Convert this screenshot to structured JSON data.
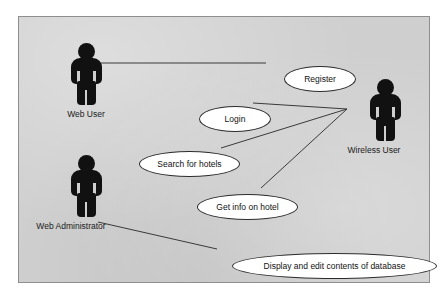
{
  "diagram": {
    "type": "uml-use-case-diagram",
    "panel": {
      "background_color": "#cfcfcf",
      "border_color": "#8e8e8e"
    },
    "scan_artifact_text": "",
    "actors": [
      {
        "id": "web-user",
        "label": "Web User"
      },
      {
        "id": "web-admin",
        "label": "Web Administrator"
      },
      {
        "id": "wireless-user",
        "label": "Wireless User"
      }
    ],
    "use_cases": [
      {
        "id": "register",
        "label": "Register"
      },
      {
        "id": "login",
        "label": "Login"
      },
      {
        "id": "search",
        "label": "Search for hotels"
      },
      {
        "id": "getinfo",
        "label": "Get info on hotel"
      },
      {
        "id": "display",
        "label": "Display and edit contents of database"
      }
    ],
    "associations": [
      {
        "from": "web-user",
        "to": "register"
      },
      {
        "from": "wireless-user",
        "to": "login"
      },
      {
        "from": "wireless-user",
        "to": "search"
      },
      {
        "from": "wireless-user",
        "to": "getinfo"
      },
      {
        "from": "web-admin",
        "to": "display"
      }
    ],
    "line_color": "#3a3a3a"
  }
}
